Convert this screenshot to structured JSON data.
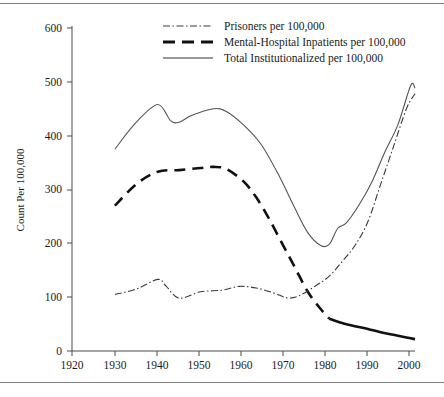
{
  "chart_data": {
    "type": "line",
    "title": "",
    "xlabel": "",
    "ylabel": "Count Per 100,000",
    "xlim": [
      1920,
      2000
    ],
    "ylim": [
      0,
      600
    ],
    "xticks": [
      1920,
      1930,
      1940,
      1950,
      1960,
      1970,
      1980,
      1990,
      2000
    ],
    "yticks": [
      0,
      100,
      200,
      300,
      400,
      500,
      600
    ],
    "grid": false,
    "legend_position": "top-center",
    "series": [
      {
        "name": "Prisoners per 100,000",
        "style": "dash-dot",
        "x": [
          1930,
          1935,
          1940,
          1942,
          1945,
          1950,
          1955,
          1959,
          1963,
          1967,
          1970,
          1972,
          1974,
          1977,
          1980,
          1983,
          1986,
          1989,
          1992,
          1995,
          1998,
          2000
        ],
        "values": [
          105,
          115,
          133,
          120,
          98,
          110,
          113,
          120,
          117,
          108,
          99,
          100,
          107,
          122,
          139,
          166,
          196,
          240,
          310,
          380,
          450,
          478
        ]
      },
      {
        "name": "Mental-Hospital Inpatients per 100,000",
        "style": "dashed",
        "x": [
          1930,
          1935,
          1940,
          1945,
          1950,
          1953,
          1956,
          1960,
          1963,
          1966,
          1969,
          1972,
          1975,
          1978,
          1980,
          1983,
          1986,
          1989,
          1992,
          1995,
          1998,
          2000
        ],
        "values": [
          270,
          310,
          333,
          336,
          340,
          342,
          338,
          315,
          285,
          245,
          200,
          155,
          110,
          78,
          60,
          52,
          46,
          41,
          35,
          30,
          25,
          22
        ]
      },
      {
        "name": "Total Institutionalized per 100,000",
        "style": "solid",
        "x": [
          1930,
          1935,
          1940,
          1943,
          1945,
          1948,
          1953,
          1956,
          1960,
          1964,
          1968,
          1972,
          1975,
          1978,
          1980,
          1982,
          1984,
          1987,
          1990,
          1993,
          1996,
          1999,
          2000
        ],
        "values": [
          375,
          425,
          458,
          428,
          425,
          438,
          450,
          445,
          420,
          385,
          330,
          265,
          220,
          196,
          198,
          228,
          238,
          272,
          315,
          370,
          420,
          493,
          488
        ]
      }
    ]
  },
  "legend": {
    "items": [
      {
        "label": "Prisoners per 100,000"
      },
      {
        "label": "Mental-Hospital Inpatients per 100,000"
      },
      {
        "label": "Total Institutionalized per 100,000"
      }
    ]
  },
  "axes": {
    "y_title": "Count Per 100,000",
    "y_tick_labels": [
      "600",
      "500",
      "400",
      "300",
      "200",
      "100",
      "0"
    ],
    "x_tick_labels": [
      "1920",
      "1930",
      "1940",
      "1950",
      "1960",
      "1970",
      "1980",
      "1990",
      "2000"
    ]
  }
}
